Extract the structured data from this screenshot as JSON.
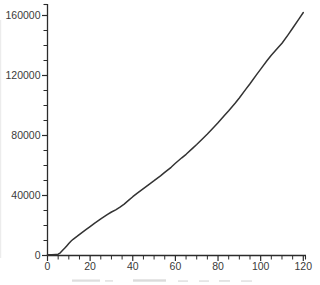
{
  "chart_data": {
    "type": "line",
    "title": "",
    "xlabel": "",
    "ylabel": "",
    "xlim": [
      0,
      120
    ],
    "ylim": [
      0,
      160000
    ],
    "grid": false,
    "legend": null,
    "x_major_ticks": [
      0,
      20,
      40,
      60,
      80,
      100,
      120
    ],
    "x_tick_labels": [
      "0",
      "20",
      "40",
      "60",
      "80",
      "100",
      "120"
    ],
    "x_minor_step": 5,
    "y_major_ticks": [
      0,
      40000,
      80000,
      120000,
      160000
    ],
    "y_tick_labels": [
      "0",
      "40000",
      "80000",
      "120000",
      "160000"
    ],
    "y_minor_step": 10000,
    "series": [
      {
        "name": "curve",
        "color": "#333333",
        "points": [
          [
            0,
            500
          ],
          [
            2,
            550
          ],
          [
            4,
            700
          ],
          [
            5,
            900
          ],
          [
            6,
            1800
          ],
          [
            7,
            3300
          ],
          [
            8,
            4800
          ],
          [
            9,
            6400
          ],
          [
            10,
            8000
          ],
          [
            11,
            9500
          ],
          [
            12,
            10800
          ],
          [
            14,
            12900
          ],
          [
            16,
            15100
          ],
          [
            18,
            17200
          ],
          [
            20,
            19300
          ],
          [
            22,
            21500
          ],
          [
            25,
            24400
          ],
          [
            28,
            27300
          ],
          [
            30,
            29000
          ],
          [
            32,
            30500
          ],
          [
            34,
            32300
          ],
          [
            36,
            34300
          ],
          [
            38,
            36700
          ],
          [
            40,
            39200
          ],
          [
            42,
            41400
          ],
          [
            45,
            44600
          ],
          [
            48,
            47800
          ],
          [
            50,
            49900
          ],
          [
            53,
            53100
          ],
          [
            55,
            55400
          ],
          [
            58,
            58800
          ],
          [
            60,
            61500
          ],
          [
            63,
            65100
          ],
          [
            65,
            67500
          ],
          [
            68,
            71400
          ],
          [
            70,
            74000
          ],
          [
            73,
            78200
          ],
          [
            75,
            81000
          ],
          [
            78,
            85500
          ],
          [
            80,
            88500
          ],
          [
            83,
            93300
          ],
          [
            85,
            96500
          ],
          [
            88,
            101500
          ],
          [
            90,
            105000
          ],
          [
            93,
            110700
          ],
          [
            95,
            114500
          ],
          [
            98,
            120400
          ],
          [
            100,
            124300
          ],
          [
            103,
            130000
          ],
          [
            105,
            133500
          ],
          [
            108,
            138300
          ],
          [
            110,
            141500
          ],
          [
            113,
            147400
          ],
          [
            115,
            151500
          ],
          [
            118,
            157700
          ],
          [
            120,
            162000
          ]
        ]
      }
    ]
  },
  "colors": {
    "background": "#ffffff",
    "axis": "#2b2b2b",
    "tick_label": "#3a3a3a",
    "line": "#333333"
  }
}
